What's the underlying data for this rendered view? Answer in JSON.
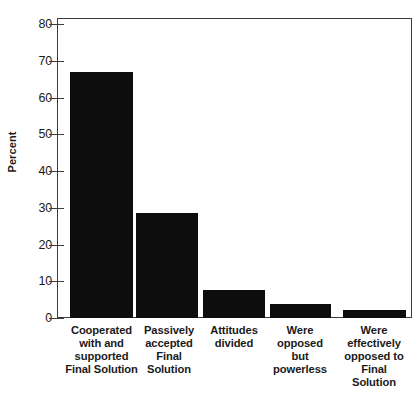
{
  "chart_data": {
    "type": "bar",
    "title": "",
    "xlabel": "",
    "ylabel": "Percent",
    "ylim": [
      0,
      80
    ],
    "ytick_values": [
      0,
      10,
      20,
      30,
      40,
      50,
      60,
      70,
      80
    ],
    "ytick_labels": [
      "0",
      "10",
      "20",
      "30",
      "40",
      "50",
      "60",
      "70",
      "80"
    ],
    "grid": false,
    "legend": null,
    "bar_color": "#0d0d0d",
    "axis_color": "#3c3c3c",
    "background_color": "#ffffff",
    "categories": [
      "Cooperated\nwith and\nsupported\nFinal Solution",
      "Passively\naccepted\nFinal\nSolution",
      "Attitudes\ndivided",
      "Were\nopposed\nbut\npowerless",
      "Were\neffectively\nopposed to\nFinal\nSolution"
    ],
    "values": [
      67,
      28.5,
      7.5,
      3.8,
      2.2
    ]
  }
}
